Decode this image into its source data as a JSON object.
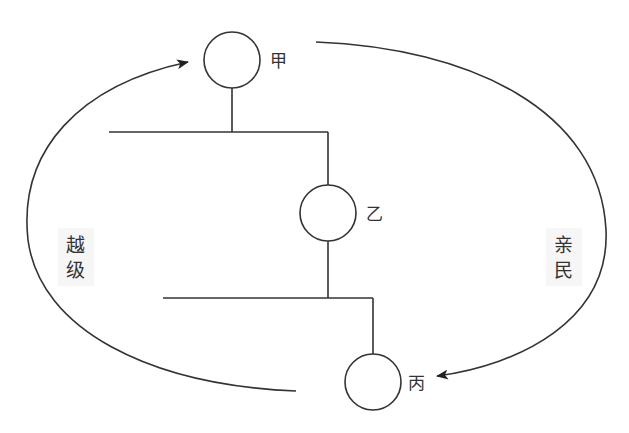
{
  "diagram": {
    "nodes": [
      {
        "id": "jia",
        "label": "甲",
        "cx": 232,
        "cy": 60,
        "r": 28
      },
      {
        "id": "yi",
        "label": "乙",
        "cx": 328,
        "cy": 213,
        "r": 28
      },
      {
        "id": "bing",
        "label": "丙",
        "cx": 373,
        "cy": 382,
        "r": 28
      }
    ],
    "arcs": [
      {
        "id": "yueji",
        "label_chars": [
          "越",
          "级"
        ],
        "from": "丙",
        "to": "甲",
        "side": "left"
      },
      {
        "id": "qinmin",
        "label_chars": [
          "亲",
          "民"
        ],
        "from": "甲",
        "to": "丙",
        "side": "right"
      }
    ],
    "colors": {
      "line": "#333333",
      "background": "#ffffff"
    }
  }
}
